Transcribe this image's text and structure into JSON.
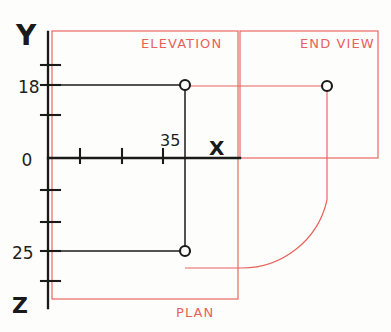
{
  "sheet": {
    "width": 391,
    "height": 332,
    "background_color": "#fdfdfb",
    "title": "Orthographic projection sketch with elevation, plan and end view"
  },
  "colors": {
    "ink_black": "#1a1a1a",
    "ink_red": "#e8625c",
    "paper": "#fdfdfb"
  },
  "axes": {
    "origin": {
      "x": 48,
      "y": 158
    },
    "y_axis": {
      "label": "Y",
      "label_x": 22,
      "label_y": 42,
      "direction": "up"
    },
    "x_axis": {
      "label": "X",
      "label_x": 211,
      "label_y": 154,
      "direction": "right"
    },
    "z_axis": {
      "label": "Z",
      "label_x": 14,
      "label_y": 312,
      "direction": "down"
    },
    "origin_label": "0",
    "origin_label_x": 16,
    "origin_label_y": 165
  },
  "tick_labels": [
    {
      "name": "elevation-height",
      "text": "18",
      "x": 16,
      "y": 92,
      "axis": "y"
    },
    {
      "name": "origin-zero",
      "text": "0",
      "x": 16,
      "y": 165,
      "axis": "y"
    },
    {
      "name": "plan-depth",
      "text": "25",
      "x": 10,
      "y": 259,
      "axis": "z"
    },
    {
      "name": "x-distance",
      "text": "35",
      "x": 160,
      "y": 146,
      "axis": "x"
    }
  ],
  "y_ticks": [
    65,
    85,
    115
  ],
  "z_ticks": [
    190,
    222,
    251,
    281
  ],
  "x_ticks": [
    80,
    122,
    163
  ],
  "views": [
    {
      "name": "elevation",
      "label": "ELEVATION",
      "label_x": 141,
      "label_y": 48,
      "frame": {
        "x": 52,
        "y": 31,
        "w": 186,
        "h": 127
      }
    },
    {
      "name": "end-view",
      "label": "END VIEW",
      "label_x": 301,
      "label_y": 48,
      "frame": {
        "x": 240,
        "y": 31,
        "w": 138,
        "h": 127
      }
    },
    {
      "name": "plan",
      "label": "PLAN",
      "label_x": 175,
      "label_y": 315,
      "frame": {
        "x": 52,
        "y": 158,
        "w": 186,
        "h": 141
      }
    }
  ],
  "points": [
    {
      "name": "elevation-point",
      "x": 185,
      "y": 85,
      "r": 5,
      "color": "#1a1a1a"
    },
    {
      "name": "plan-point",
      "x": 185,
      "y": 251,
      "r": 5,
      "color": "#1a1a1a"
    },
    {
      "name": "end-view-point",
      "x": 327,
      "y": 86,
      "r": 5,
      "color": "#1a1a1a"
    }
  ],
  "construction_lines": {
    "elevation_horizontal": {
      "x1": 48,
      "y1": 85,
      "x2": 185,
      "y2": 85
    },
    "elevation_vertical": {
      "x1": 185,
      "y1": 85,
      "x2": 185,
      "y2": 251
    },
    "plan_horizontal": {
      "x1": 48,
      "y1": 251,
      "x2": 185,
      "y2": 251
    }
  },
  "red_construction": {
    "end_view_horizontal": {
      "x1": 185,
      "y1": 86,
      "x2": 327,
      "y2": 86
    },
    "end_view_vertical": {
      "x1": 327,
      "y1": 86,
      "x2": 327,
      "y2": 205
    },
    "plan_tie_horizontal": {
      "x1": 185,
      "y1": 268,
      "x2": 245,
      "y2": 268
    },
    "arc_description": "quarter circle from end view down to plan level",
    "arc_center_x": 240,
    "arc_center_y": 268,
    "arc_radius": 87
  },
  "chart_data": {
    "type": "scatter",
    "xlabel": "X",
    "ylabel": "Y",
    "zlabel": "Z",
    "annotations": [
      "ELEVATION",
      "END VIEW",
      "PLAN"
    ],
    "tick_values_y": [
      "18",
      "0"
    ],
    "tick_values_z": [
      "25"
    ],
    "tick_values_x": [
      "35"
    ],
    "points": [
      {
        "view": "elevation",
        "x": 35,
        "y": 18
      },
      {
        "view": "plan",
        "x": 35,
        "z": 25
      },
      {
        "view": "end-view",
        "depth": 25,
        "height": 18
      }
    ]
  }
}
